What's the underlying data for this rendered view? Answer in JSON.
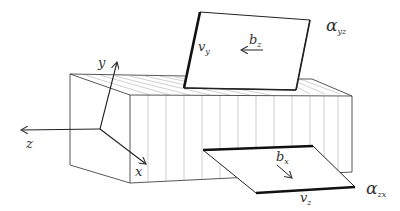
{
  "diagram": {
    "axes": {
      "x": "x",
      "y": "y",
      "z": "z"
    },
    "upper_plane": {
      "name": "α",
      "name_sub": "yz",
      "edge_label": "v",
      "edge_label_sub": "y",
      "vector_label": "b",
      "vector_label_sub": "z"
    },
    "lower_plane": {
      "name": "α",
      "name_sub": "zx",
      "edge_label": "v",
      "edge_label_sub": "z",
      "vector_label": "b",
      "vector_label_sub": "x"
    },
    "colors": {
      "line": "#333333",
      "hatch": "#9a9a9a",
      "text": "#333333"
    }
  }
}
